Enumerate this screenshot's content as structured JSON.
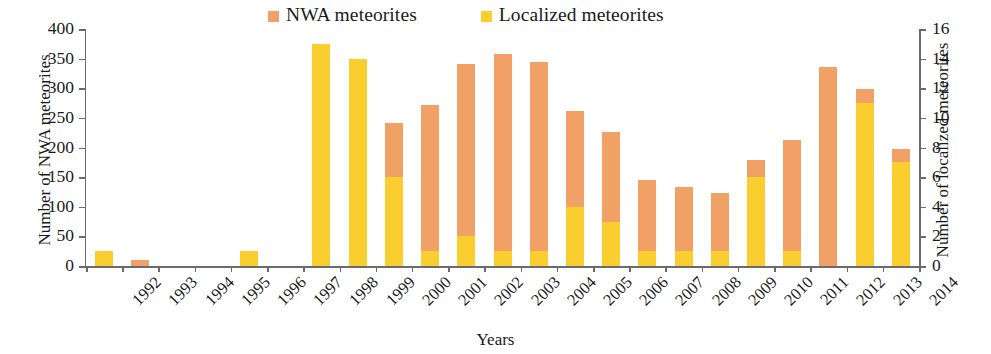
{
  "chart_data": {
    "type": "bar",
    "stacked": true,
    "title": "",
    "xlabel": "Years",
    "ylabel": "Number of NWA meteorites",
    "y2label": "Number of localized meteorites",
    "ylim": [
      0,
      400
    ],
    "y2lim": [
      0,
      16
    ],
    "yticks": [
      0,
      50,
      100,
      150,
      200,
      250,
      300,
      350,
      400
    ],
    "y2ticks": [
      0,
      2,
      4,
      6,
      8,
      10,
      12,
      14,
      16
    ],
    "grid": false,
    "legend_position": "top",
    "categories": [
      "1992",
      "1993",
      "1994",
      "1995",
      "1996",
      "1997",
      "1998",
      "1999",
      "2000",
      "2001",
      "2002",
      "2003",
      "2004",
      "2005",
      "2006",
      "2007",
      "2008",
      "2009",
      "2010",
      "2011",
      "2012",
      "2013",
      "2014"
    ],
    "series": [
      {
        "name": "Localized meteorites",
        "axis": "right",
        "color": "#f9ce2e",
        "values": [
          1,
          0,
          0,
          0,
          1,
          0,
          15,
          14,
          6,
          1,
          2,
          1,
          1,
          4,
          3,
          1,
          1,
          1,
          6,
          1,
          0,
          11,
          7
        ]
      },
      {
        "name": "NWA meteorites",
        "axis": "left",
        "color": "#f2a166",
        "values": [
          0,
          10,
          0,
          0,
          0,
          0,
          0,
          0,
          92,
          247,
          291,
          333,
          319,
          162,
          152,
          121,
          109,
          99,
          29,
          188,
          336,
          24,
          23
        ]
      }
    ],
    "bar_totals_nwa_scale": [
      25,
      10,
      0,
      0,
      25,
      0,
      370,
      347,
      242,
      272,
      341,
      358,
      344,
      262,
      227,
      146,
      134,
      124,
      179,
      213,
      336,
      299,
      198
    ]
  },
  "legend": {
    "items": [
      {
        "label": "NWA meteorites",
        "color": "#f2a166",
        "swatch": "square-swatch"
      },
      {
        "label": "Localized meteorites",
        "color": "#f9ce2e",
        "swatch": "square-swatch"
      }
    ]
  },
  "axes": {
    "left_title": "Number of NWA meteorites",
    "right_title": "Number of localized meteorites",
    "x_title": "Years"
  }
}
